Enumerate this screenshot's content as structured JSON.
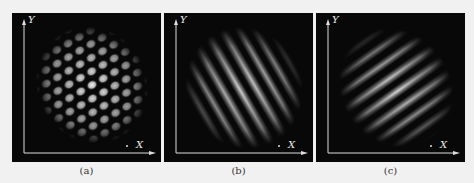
{
  "figure": {
    "panels": [
      {
        "id": "a",
        "caption": "(a)",
        "y_axis_label": "Y",
        "x_axis_label": "X",
        "pattern": "spot-lattice"
      },
      {
        "id": "b",
        "caption": "(b)",
        "y_axis_label": "Y",
        "x_axis_label": "X",
        "pattern": "diagonal-fringes-broad"
      },
      {
        "id": "c",
        "caption": "(c)",
        "y_axis_label": "Y",
        "x_axis_label": "X",
        "pattern": "diagonal-fringes-narrow"
      }
    ],
    "colors": {
      "background": "#f1f1f1",
      "panel": "#080808",
      "signal": "#dcdcdc",
      "axis": "#e0e0e0"
    }
  }
}
